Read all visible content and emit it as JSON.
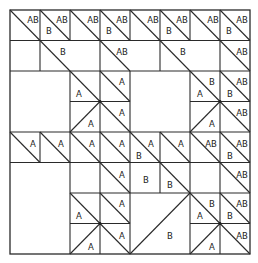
{
  "diagram": {
    "title": "",
    "grid": {
      "cols": 8,
      "rows": 8
    },
    "labels": [
      {
        "id": "r0c0a",
        "text": "AB",
        "x": 33,
        "y": 20
      },
      {
        "id": "r0c1a",
        "text": "AB",
        "x": 62,
        "y": 20
      },
      {
        "id": "r0c1b",
        "text": "B",
        "x": 49,
        "y": 31
      },
      {
        "id": "r0c2a",
        "text": "AB",
        "x": 93,
        "y": 20
      },
      {
        "id": "r0c3a",
        "text": "AB",
        "x": 122,
        "y": 20
      },
      {
        "id": "r0c3b",
        "text": "B",
        "x": 109,
        "y": 31
      },
      {
        "id": "r0c4a",
        "text": "AB",
        "x": 153,
        "y": 20
      },
      {
        "id": "r0c5a",
        "text": "AB",
        "x": 182,
        "y": 20
      },
      {
        "id": "r0c5b",
        "text": "B",
        "x": 169,
        "y": 31
      },
      {
        "id": "r0c6a",
        "text": "AB",
        "x": 213,
        "y": 20
      },
      {
        "id": "r0c7a",
        "text": "AB",
        "x": 242,
        "y": 20
      },
      {
        "id": "r0c7b",
        "text": "B",
        "x": 229,
        "y": 31
      },
      {
        "id": "r1c1a",
        "text": "B",
        "x": 63,
        "y": 52
      },
      {
        "id": "r1c3a",
        "text": "AB",
        "x": 122,
        "y": 52
      },
      {
        "id": "r1c5a",
        "text": "B",
        "x": 183,
        "y": 52
      },
      {
        "id": "r1c7a",
        "text": "AB",
        "x": 242,
        "y": 52
      },
      {
        "id": "r2c2a",
        "text": "A",
        "x": 79,
        "y": 94
      },
      {
        "id": "r2c3a",
        "text": "A",
        "x": 122,
        "y": 82
      },
      {
        "id": "r3c2a",
        "text": "A",
        "x": 91,
        "y": 124
      },
      {
        "id": "r3c3a",
        "text": "A",
        "x": 122,
        "y": 113
      },
      {
        "id": "r2c6a",
        "text": "B",
        "x": 212,
        "y": 82
      },
      {
        "id": "r2c6b",
        "text": "A",
        "x": 200,
        "y": 94
      },
      {
        "id": "r2c7a",
        "text": "AB",
        "x": 242,
        "y": 82
      },
      {
        "id": "r2c7b",
        "text": "B",
        "x": 230,
        "y": 94
      },
      {
        "id": "r3c6a",
        "text": "A",
        "x": 212,
        "y": 124
      },
      {
        "id": "r3c7a",
        "text": "AB",
        "x": 242,
        "y": 113
      },
      {
        "id": "r4c0a",
        "text": "A",
        "x": 33,
        "y": 144
      },
      {
        "id": "r4c1a",
        "text": "A",
        "x": 61,
        "y": 144
      },
      {
        "id": "r4c2a",
        "text": "A",
        "x": 92,
        "y": 144
      },
      {
        "id": "r4c3a",
        "text": "A",
        "x": 122,
        "y": 144
      },
      {
        "id": "r4c4a",
        "text": "A",
        "x": 151,
        "y": 144
      },
      {
        "id": "r4c4b",
        "text": "B",
        "x": 139,
        "y": 156
      },
      {
        "id": "r4c5a",
        "text": "A",
        "x": 181,
        "y": 144
      },
      {
        "id": "r4c6a",
        "text": "AB",
        "x": 211,
        "y": 144
      },
      {
        "id": "r4c7a",
        "text": "AB",
        "x": 242,
        "y": 144
      },
      {
        "id": "r4c7b",
        "text": "B",
        "x": 230,
        "y": 156
      },
      {
        "id": "r5c3a",
        "text": "A",
        "x": 122,
        "y": 175
      },
      {
        "id": "r5c4a",
        "text": "B",
        "x": 146,
        "y": 180
      },
      {
        "id": "r5c5a",
        "text": "B",
        "x": 170,
        "y": 185
      },
      {
        "id": "r5c7a",
        "text": "AB",
        "x": 242,
        "y": 175
      },
      {
        "id": "r6c2a",
        "text": "A",
        "x": 79,
        "y": 216
      },
      {
        "id": "r6c3a",
        "text": "A",
        "x": 122,
        "y": 204
      },
      {
        "id": "r7c2a",
        "text": "A",
        "x": 91,
        "y": 247
      },
      {
        "id": "r7c3a",
        "text": "A",
        "x": 122,
        "y": 236
      },
      {
        "id": "r67c45a",
        "text": "B",
        "x": 170,
        "y": 236
      },
      {
        "id": "r6c6a",
        "text": "B",
        "x": 212,
        "y": 204
      },
      {
        "id": "r6c6b",
        "text": "A",
        "x": 200,
        "y": 216
      },
      {
        "id": "r6c7a",
        "text": "AB",
        "x": 242,
        "y": 204
      },
      {
        "id": "r6c7b",
        "text": "B",
        "x": 230,
        "y": 216
      },
      {
        "id": "r7c6a",
        "text": "A",
        "x": 212,
        "y": 247
      },
      {
        "id": "r7c7a",
        "text": "AB",
        "x": 242,
        "y": 236
      }
    ]
  }
}
